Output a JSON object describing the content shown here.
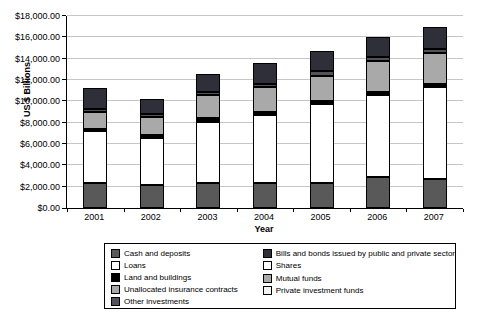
{
  "chart_data": {
    "type": "bar",
    "stacked": true,
    "title": "",
    "xlabel": "Year",
    "ylabel": "US $ Billions",
    "ylim": [
      0,
      18000
    ],
    "y_tick_step": 2000,
    "y_tick_labels": [
      "$0.00",
      "$2,000.00",
      "$4,000.00",
      "$6,000.00",
      "$8,000.00",
      "$10,000.00",
      "$12,000.00",
      "$14,000.00",
      "$16,000.00",
      "$18,000.00"
    ],
    "grid": true,
    "gridline_color": "#c6c6c6",
    "legend_position": "bottom",
    "legend_columns": [
      [
        0,
        1,
        2,
        3,
        4
      ],
      [
        5,
        6,
        7,
        8
      ]
    ],
    "categories": [
      "2001",
      "2002",
      "2003",
      "2004",
      "2005",
      "2006",
      "2007"
    ],
    "series": [
      {
        "name": "Cash and deposits",
        "color": "#595959",
        "values": [
          2300,
          2150,
          2300,
          2300,
          2350,
          2900,
          2750
        ]
      },
      {
        "name": "Loans",
        "color": "#ffffff",
        "values": [
          4950,
          4400,
          5800,
          6400,
          7400,
          7700,
          8600
        ]
      },
      {
        "name": "Land and buildings",
        "color": "#000000",
        "values": [
          200,
          300,
          300,
          300,
          300,
          300,
          300
        ]
      },
      {
        "name": "Unallocated insurance contracts",
        "color": "#a9a9a9",
        "values": [
          1550,
          1700,
          2200,
          2350,
          2350,
          2900,
          2900
        ]
      },
      {
        "name": "Other investments",
        "color": "#52525a",
        "values": [
          300,
          300,
          300,
          300,
          400,
          400,
          400
        ]
      },
      {
        "name": "Bills and bonds issued by public and private sector",
        "color": "#2f2f3a",
        "values": [
          1950,
          1400,
          1700,
          1900,
          1950,
          1850,
          2050
        ]
      },
      {
        "name": "Shares",
        "color": "#ffffff",
        "values": [
          0,
          0,
          0,
          0,
          0,
          0,
          0
        ]
      },
      {
        "name": "Mutual funds",
        "color": "#a9a9a9",
        "values": [
          0,
          0,
          0,
          0,
          0,
          0,
          0
        ]
      },
      {
        "name": "Private investment funds",
        "color": "#f2f2f2",
        "values": [
          0,
          0,
          0,
          0,
          0,
          0,
          0
        ]
      }
    ],
    "totals": [
      11250,
      10250,
      12600,
      13550,
      14750,
      16050,
      17000
    ]
  }
}
